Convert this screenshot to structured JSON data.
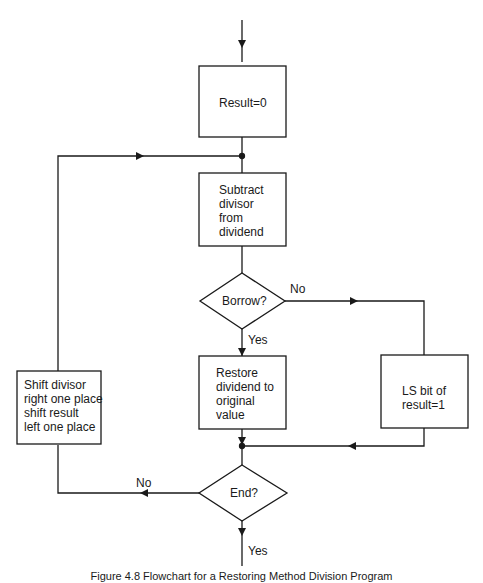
{
  "diagram": {
    "type": "flowchart",
    "nodes": {
      "init": {
        "shape": "rectangle",
        "text": "Result=0"
      },
      "subtract": {
        "shape": "rectangle",
        "text": "Subtract\ndivisor\nfrom\ndividend"
      },
      "borrow": {
        "shape": "diamond",
        "text": "Borrow?"
      },
      "restore": {
        "shape": "rectangle",
        "text": "Restore\ndividend to\noriginal\nvalue"
      },
      "lsbit": {
        "shape": "rectangle",
        "text": "LS bit of\nresult=1"
      },
      "shift": {
        "shape": "rectangle",
        "text": "Shift divisor\nright one place\nshift result\nleft one place"
      },
      "end": {
        "shape": "diamond",
        "text": "End?"
      }
    },
    "edge_labels": {
      "borrow_no": "No",
      "borrow_yes": "Yes",
      "end_no": "No",
      "end_yes": "Yes"
    },
    "edges": [
      {
        "from": "start",
        "to": "init"
      },
      {
        "from": "init",
        "to": "subtract"
      },
      {
        "from": "subtract",
        "to": "borrow"
      },
      {
        "from": "borrow",
        "to": "restore",
        "label": "Yes"
      },
      {
        "from": "borrow",
        "to": "lsbit",
        "label": "No"
      },
      {
        "from": "restore",
        "to": "end"
      },
      {
        "from": "lsbit",
        "to": "end"
      },
      {
        "from": "end",
        "to": "shift",
        "label": "No"
      },
      {
        "from": "shift",
        "to": "subtract"
      },
      {
        "from": "end",
        "to": "exit",
        "label": "Yes"
      }
    ]
  },
  "caption": "Figure 4.8 Flowchart for a Restoring Method Division Program"
}
